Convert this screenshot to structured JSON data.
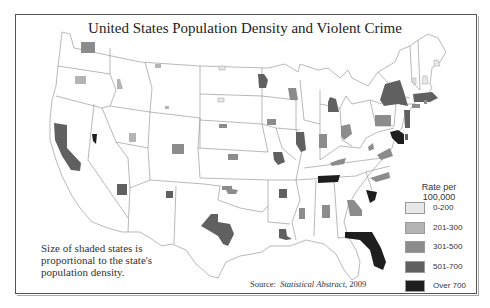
{
  "title": "United States Population Density and Violent Crime",
  "note": {
    "lines": [
      "Size of shaded states is",
      "proportional to the state's",
      "population density."
    ]
  },
  "source": {
    "prefix": "Source:",
    "publication": "Statistical Abstract,",
    "year": "2009"
  },
  "legend": {
    "title_line1": "Rate per",
    "title_line2": "100,000",
    "items": [
      {
        "label": "0-200",
        "color": "#e8e8e8"
      },
      {
        "label": "201-300",
        "color": "#b4b4b4"
      },
      {
        "label": "301-500",
        "color": "#8c8c8c"
      },
      {
        "label": "501-700",
        "color": "#606060"
      },
      {
        "label": "Over 700",
        "color": "#1e1e1e"
      }
    ]
  },
  "colors": {
    "border": "#888888",
    "frame": "#555555",
    "text": "#222222"
  },
  "states": [
    {
      "name": "Washington",
      "category": "301-500"
    },
    {
      "name": "Oregon",
      "category": "201-300"
    },
    {
      "name": "California",
      "category": "501-700"
    },
    {
      "name": "Nevada",
      "category": "Over 700"
    },
    {
      "name": "Idaho",
      "category": "201-300"
    },
    {
      "name": "Montana",
      "category": "201-300"
    },
    {
      "name": "Wyoming",
      "category": "201-300"
    },
    {
      "name": "Utah",
      "category": "201-300"
    },
    {
      "name": "Arizona",
      "category": "501-700"
    },
    {
      "name": "Colorado",
      "category": "301-500"
    },
    {
      "name": "New Mexico",
      "category": "501-700"
    },
    {
      "name": "North Dakota",
      "category": "0-200"
    },
    {
      "name": "South Dakota",
      "category": "0-200"
    },
    {
      "name": "Nebraska",
      "category": "301-500"
    },
    {
      "name": "Kansas",
      "category": "301-500"
    },
    {
      "name": "Oklahoma",
      "category": "301-500"
    },
    {
      "name": "Texas",
      "category": "501-700"
    },
    {
      "name": "Minnesota",
      "category": "501-700"
    },
    {
      "name": "Iowa",
      "category": "301-500"
    },
    {
      "name": "Missouri",
      "category": "501-700"
    },
    {
      "name": "Arkansas",
      "category": "501-700"
    },
    {
      "name": "Louisiana",
      "category": "501-700"
    },
    {
      "name": "Wisconsin",
      "category": "301-500"
    },
    {
      "name": "Illinois",
      "category": "501-700"
    },
    {
      "name": "Michigan",
      "category": "501-700"
    },
    {
      "name": "Indiana",
      "category": "301-500"
    },
    {
      "name": "Ohio",
      "category": "301-500"
    },
    {
      "name": "Kentucky",
      "category": "301-500"
    },
    {
      "name": "Tennessee",
      "category": "Over 700"
    },
    {
      "name": "Mississippi",
      "category": "301-500"
    },
    {
      "name": "Alabama",
      "category": "301-500"
    },
    {
      "name": "Georgia",
      "category": "301-500"
    },
    {
      "name": "Florida",
      "category": "Over 700"
    },
    {
      "name": "South Carolina",
      "category": "Over 700"
    },
    {
      "name": "North Carolina",
      "category": "301-500"
    },
    {
      "name": "Virginia",
      "category": "301-500"
    },
    {
      "name": "West Virginia",
      "category": "301-500"
    },
    {
      "name": "Pennsylvania",
      "category": "301-500"
    },
    {
      "name": "New York",
      "category": "501-700"
    },
    {
      "name": "New Jersey",
      "category": "501-700"
    },
    {
      "name": "Maryland",
      "category": "Over 700"
    },
    {
      "name": "Delaware",
      "category": "501-700"
    },
    {
      "name": "Massachusetts",
      "category": "501-700"
    },
    {
      "name": "Connecticut",
      "category": "301-500"
    },
    {
      "name": "Rhode Island",
      "category": "301-500"
    },
    {
      "name": "Vermont",
      "category": "0-200"
    },
    {
      "name": "New Hampshire",
      "category": "0-200"
    },
    {
      "name": "Maine",
      "category": "0-200"
    }
  ]
}
